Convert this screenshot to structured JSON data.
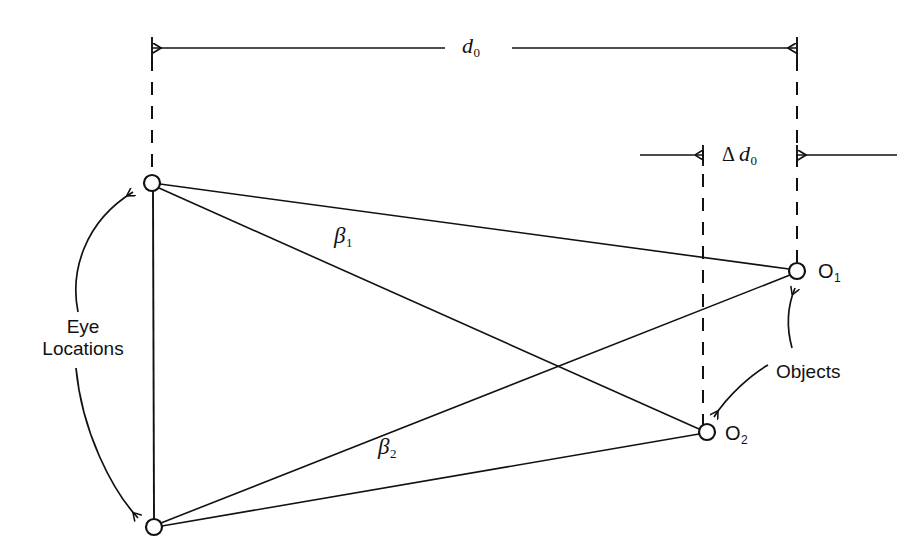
{
  "figure": {
    "type": "geometry-diagram",
    "background_color": "#ffffff",
    "line_color": "#111111"
  },
  "labels": {
    "d0": {
      "base": "d",
      "sub": "0",
      "text": "d₀"
    },
    "delta_d0": {
      "delta": "Δ",
      "base": "d",
      "sub": "0",
      "text": "Δ d₀"
    },
    "beta1": {
      "base": "β",
      "sub": "1",
      "text": "β₁"
    },
    "beta2": {
      "base": "β",
      "sub": "2",
      "text": "β₂"
    },
    "eye_locations_line1": "Eye",
    "eye_locations_line2": "Locations",
    "objects": "Objects",
    "o1": {
      "base": "O",
      "sub": "1",
      "text": "O₁"
    },
    "o2": {
      "base": "O",
      "sub": "2",
      "text": "O₂"
    }
  },
  "nodes": [
    {
      "name": "eye-top",
      "x": 152,
      "y": 183,
      "r": 8,
      "kind": "eye"
    },
    {
      "name": "eye-bottom",
      "x": 154,
      "y": 527,
      "r": 8,
      "kind": "eye"
    },
    {
      "name": "object-o1",
      "x": 797,
      "y": 271,
      "r": 8,
      "kind": "object"
    },
    {
      "name": "object-o2",
      "x": 707,
      "y": 432,
      "r": 8,
      "kind": "object"
    }
  ],
  "dimensions": [
    {
      "name": "d0",
      "y": 48,
      "from_x": 152,
      "to_x": 797,
      "arrow_direction": "outward",
      "label": "d₀"
    },
    {
      "name": "delta-d0",
      "y": 155,
      "from_x": 703,
      "to_x": 797,
      "arrow_direction": "inward",
      "label": "Δ d₀"
    }
  ],
  "reference_lines": [
    {
      "name": "dashed-eye-axis",
      "x": 152,
      "y1": 58,
      "y2": 175,
      "style": "dashed"
    },
    {
      "name": "dashed-o2-plane",
      "x": 703,
      "y1": 150,
      "y2": 426,
      "style": "dashed"
    },
    {
      "name": "dashed-o1-plane",
      "x": 797,
      "y1": 58,
      "y2": 262,
      "style": "dashed"
    },
    {
      "name": "solid-interocular-baseline",
      "x": 153,
      "y1": 191,
      "y2": 519,
      "style": "solid"
    }
  ],
  "sight_lines": [
    {
      "name": "eye-top-to-o1",
      "from": "eye-top",
      "to": "object-o1"
    },
    {
      "name": "eye-top-to-o2",
      "from": "eye-top",
      "to": "object-o2"
    },
    {
      "name": "eye-bottom-to-o1",
      "from": "eye-bottom",
      "to": "object-o1"
    },
    {
      "name": "eye-bottom-to-o2",
      "from": "eye-bottom",
      "to": "object-o2"
    }
  ],
  "annotations": [
    {
      "name": "eye-locations-brace",
      "target": [
        "eye-top",
        "eye-bottom"
      ],
      "style": "curved-double-arrow"
    },
    {
      "name": "objects-arrow-o1",
      "target": "object-o1",
      "style": "curved-arrow"
    },
    {
      "name": "objects-arrow-o2",
      "target": "object-o2",
      "style": "curved-arrow"
    }
  ]
}
